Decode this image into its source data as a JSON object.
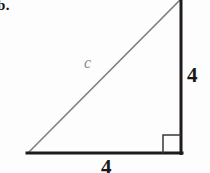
{
  "figure": {
    "problem_label": "b.",
    "type": "right-triangle-diagram",
    "background_color": "#fdfdfd",
    "labels": {
      "hypotenuse": "c",
      "vertical_leg": "4",
      "horizontal_leg": "4"
    },
    "colors": {
      "hypotenuse_stroke": "#7f8084",
      "leg_stroke": "#1e1b18",
      "right_angle_stroke": "#39363a",
      "hypotenuse_label": "#8d8d8d",
      "leg_label": "#1a1714",
      "problem_label": "#14110f"
    },
    "geometry": {
      "bottom_left_x": 28,
      "bottom_left_y": 153,
      "bottom_right_x": 181,
      "bottom_right_y": 153,
      "top_right_x": 181,
      "top_right_y": 0,
      "right_angle_marker_size": 18,
      "hypotenuse_width": 1.6,
      "leg_width": 3
    }
  }
}
